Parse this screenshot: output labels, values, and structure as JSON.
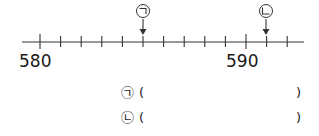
{
  "chart_data": {
    "type": "number_line",
    "start_label": "580",
    "end_label": "590",
    "labeled_ticks": [
      {
        "value": 580,
        "label": "580"
      },
      {
        "value": 590,
        "label": "590"
      }
    ],
    "tick_interval": 1,
    "range": [
      580,
      592
    ],
    "markers": [
      {
        "label": "㉠",
        "value": 585
      },
      {
        "label": "㉡",
        "value": 591
      }
    ]
  },
  "numberline": {
    "label_580": "580",
    "label_590": "590",
    "marker_a": "㉠",
    "marker_b": "㉡"
  },
  "answers": [
    {
      "marker": "㉠",
      "open": "(",
      "close": ")",
      "value": ""
    },
    {
      "marker": "㉡",
      "open": "(",
      "close": ")",
      "value": ""
    }
  ]
}
